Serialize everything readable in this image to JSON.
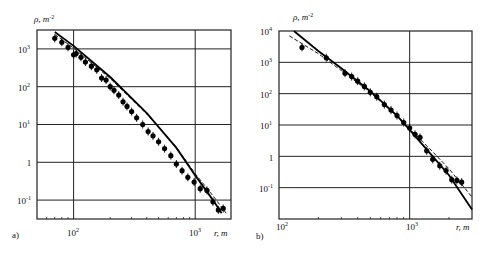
{
  "chart_data": [
    {
      "panel": "a)",
      "type": "scatter",
      "ylabel": "ρ, m⁻²",
      "xlabel": "r, m",
      "xscale": "log",
      "yscale": "log",
      "xlim": [
        50,
        1970
      ],
      "ylim": [
        0.0316,
        3162
      ],
      "xticks": [
        "10^2",
        "10^3"
      ],
      "yticks": [
        "10^3",
        "10^2",
        "10^1",
        "1",
        "10^-1"
      ],
      "grid": true,
      "frame": {
        "x0": 37,
        "y0": 30,
        "x1": 231,
        "y1": 219
      },
      "series": [
        {
          "name": "measured",
          "style": "points",
          "x": [
            70,
            80,
            90,
            100,
            105,
            115,
            125,
            140,
            155,
            170,
            185,
            200,
            215,
            235,
            255,
            275,
            300,
            330,
            370,
            410,
            450,
            500,
            560,
            630,
            700,
            780,
            870,
            980,
            1100,
            1250,
            1400,
            1550,
            1700
          ],
          "y": [
            1900,
            1500,
            1100,
            700,
            750,
            600,
            450,
            350,
            280,
            170,
            150,
            100,
            80,
            60,
            40,
            30,
            22,
            15,
            10,
            6.5,
            5,
            3.5,
            2.3,
            1.5,
            0.9,
            0.6,
            0.4,
            0.3,
            0.2,
            0.18,
            0.09,
            0.055,
            0.06
          ]
        },
        {
          "name": "fit solid",
          "style": "solid",
          "x": [
            70,
            100,
            200,
            400,
            700,
            1000,
            1400,
            1650
          ],
          "y": [
            2800,
            1200,
            180,
            20,
            2.4,
            0.45,
            0.1,
            0.045
          ]
        },
        {
          "name": "fit dashed",
          "style": "dashed",
          "x": [
            70,
            100,
            200,
            400,
            700,
            1000,
            1400,
            1800
          ],
          "y": [
            2400,
            1050,
            165,
            19,
            2.5,
            0.5,
            0.13,
            0.045
          ]
        }
      ]
    },
    {
      "panel": "b)",
      "type": "scatter",
      "ylabel": "ρ, m⁻²",
      "xlabel": "r, m",
      "xscale": "log",
      "yscale": "log",
      "xlim": [
        100,
        3000
      ],
      "ylim": [
        0.01,
        10000
      ],
      "xticks": [
        "10^2",
        "10^3"
      ],
      "yticks": [
        "10^4",
        "10^3",
        "10^2",
        "10^1",
        "1",
        "10^-1"
      ],
      "grid": true,
      "frame": {
        "x0": 279,
        "y0": 31,
        "x1": 472,
        "y1": 219
      },
      "series": [
        {
          "name": "measured",
          "style": "points",
          "x": [
            150,
            230,
            320,
            360,
            400,
            450,
            500,
            560,
            640,
            720,
            800,
            900,
            1000,
            1100,
            1200,
            1350,
            1500,
            1700,
            1900,
            2100,
            2300,
            2500
          ],
          "y": [
            3000,
            1400,
            450,
            350,
            250,
            170,
            110,
            80,
            45,
            30,
            20,
            12,
            8,
            5,
            4,
            1.5,
            0.8,
            0.5,
            0.35,
            0.18,
            0.17,
            0.15
          ]
        },
        {
          "name": "fit solid",
          "style": "solid",
          "x": [
            130,
            200,
            300,
            500,
            800,
            1000,
            1500,
            2000,
            3000
          ],
          "y": [
            10000,
            2300,
            650,
            120,
            20,
            7,
            1.0,
            0.25,
            0.02
          ]
        },
        {
          "name": "fit dashed",
          "style": "dashed",
          "x": [
            120,
            200,
            300,
            500,
            800,
            1000,
            1500,
            2000,
            3000
          ],
          "y": [
            7000,
            1900,
            550,
            110,
            19,
            7.5,
            1.4,
            0.4,
            0.05
          ]
        }
      ]
    }
  ],
  "panels": {
    "a": {
      "label": "a)",
      "ylabel": "ρ, m",
      "ylabel_exp": "-2",
      "xlabel": "r, m",
      "yt": [
        "10",
        "10",
        "10",
        "1",
        "10"
      ],
      "yt_exp": [
        "3",
        "2",
        "1",
        "",
        "-1"
      ],
      "xt": [
        "10",
        "10"
      ],
      "xt_exp": [
        "2",
        "3"
      ]
    },
    "b": {
      "label": "b)",
      "ylabel": "ρ, m",
      "ylabel_exp": "-2",
      "xlabel": "r, m",
      "yt": [
        "10",
        "10",
        "10",
        "10",
        "1",
        "10"
      ],
      "yt_exp": [
        "4",
        "3",
        "2",
        "1",
        "",
        "-1"
      ],
      "xt": [
        "10",
        "10"
      ],
      "xt_exp": [
        "2",
        "3"
      ]
    }
  }
}
